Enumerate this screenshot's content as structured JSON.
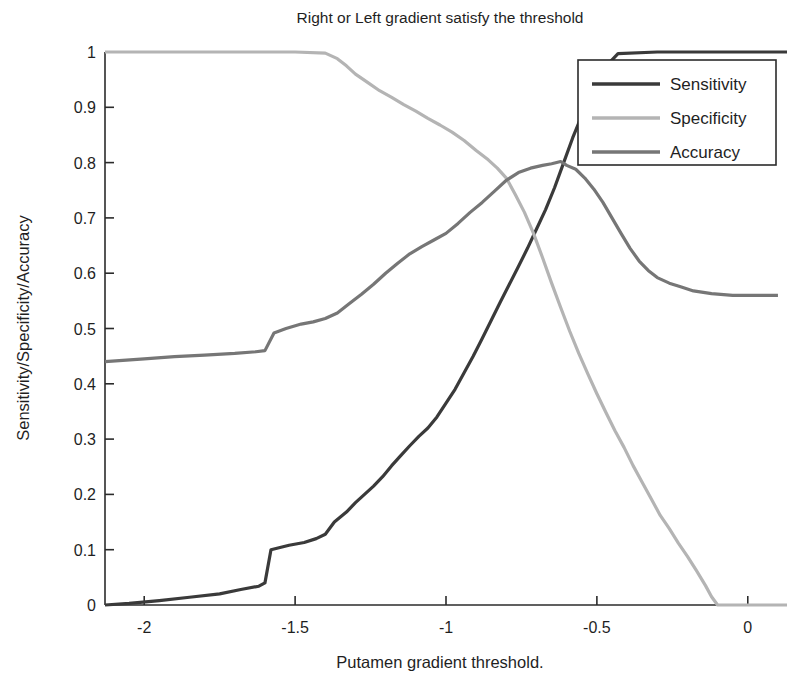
{
  "figure": {
    "title": "Right or Left gradient satisfy the threshold",
    "xlabel": "Putamen gradient threshold.",
    "ylabel": "Sensitivity/Specificity/Accuracy",
    "background": "#ffffff"
  },
  "legend": {
    "position": "top-right",
    "entries": [
      {
        "label": "Sensitivity",
        "color": "#3a3a3a"
      },
      {
        "label": "Specificity",
        "color": "#b4b4b4"
      },
      {
        "label": "Accuracy",
        "color": "#767676"
      }
    ]
  },
  "axes": {
    "x_ticks": [
      "-2",
      "-1.5",
      "-1",
      "-0.5",
      "0"
    ],
    "x_tick_values": [
      -2,
      -1.5,
      -1,
      -0.5,
      0
    ],
    "y_ticks": [
      "0",
      "0.1",
      "0.2",
      "0.3",
      "0.4",
      "0.5",
      "0.6",
      "0.7",
      "0.8",
      "0.9",
      "1"
    ],
    "y_tick_values": [
      0,
      0.1,
      0.2,
      0.3,
      0.4,
      0.5,
      0.6,
      0.7,
      0.8,
      0.9,
      1
    ],
    "xlim": [
      -2.13,
      0.13
    ],
    "ylim": [
      0,
      1
    ],
    "grid": false
  },
  "chart_data": {
    "type": "line",
    "title": "Right or Left gradient satisfy the threshold",
    "xlabel": "Putamen gradient threshold.",
    "ylabel": "Sensitivity/Specificity/Accuracy",
    "xlim": [
      -2.13,
      0.13
    ],
    "ylim": [
      0,
      1
    ],
    "grid": false,
    "legend_position": "top-right",
    "series": [
      {
        "name": "Sensitivity",
        "color": "#3a3a3a",
        "x": [
          -2.13,
          -2.05,
          -1.95,
          -1.85,
          -1.75,
          -1.68,
          -1.62,
          -1.6,
          -1.58,
          -1.52,
          -1.47,
          -1.43,
          -1.4,
          -1.37,
          -1.33,
          -1.3,
          -1.27,
          -1.24,
          -1.21,
          -1.18,
          -1.15,
          -1.12,
          -1.09,
          -1.06,
          -1.03,
          -1.0,
          -0.97,
          -0.94,
          -0.91,
          -0.88,
          -0.85,
          -0.82,
          -0.79,
          -0.76,
          -0.73,
          -0.7,
          -0.67,
          -0.64,
          -0.61,
          -0.58,
          -0.55,
          -0.52,
          -0.49,
          -0.46,
          -0.43,
          -0.3,
          -0.15,
          0.0,
          0.13
        ],
        "y": [
          0.0,
          0.003,
          0.008,
          0.014,
          0.02,
          0.028,
          0.034,
          0.04,
          0.1,
          0.108,
          0.113,
          0.12,
          0.128,
          0.15,
          0.168,
          0.185,
          0.2,
          0.215,
          0.232,
          0.252,
          0.27,
          0.288,
          0.305,
          0.32,
          0.34,
          0.365,
          0.39,
          0.42,
          0.45,
          0.482,
          0.515,
          0.548,
          0.58,
          0.612,
          0.645,
          0.68,
          0.715,
          0.755,
          0.8,
          0.845,
          0.885,
          0.92,
          0.955,
          0.98,
          0.997,
          1.0,
          1.0,
          1.0,
          1.0
        ]
      },
      {
        "name": "Specificity",
        "color": "#b4b4b4",
        "x": [
          -2.13,
          -1.8,
          -1.5,
          -1.4,
          -1.36,
          -1.33,
          -1.3,
          -1.26,
          -1.22,
          -1.18,
          -1.14,
          -1.1,
          -1.06,
          -1.02,
          -0.98,
          -0.94,
          -0.9,
          -0.86,
          -0.83,
          -0.8,
          -0.77,
          -0.74,
          -0.71,
          -0.68,
          -0.65,
          -0.62,
          -0.59,
          -0.56,
          -0.53,
          -0.5,
          -0.47,
          -0.44,
          -0.41,
          -0.38,
          -0.35,
          -0.32,
          -0.29,
          -0.26,
          -0.23,
          -0.2,
          -0.17,
          -0.14,
          -0.12,
          -0.1,
          0.0,
          0.13
        ],
        "y": [
          1.0,
          1.0,
          1.0,
          0.998,
          0.988,
          0.975,
          0.96,
          0.945,
          0.93,
          0.918,
          0.905,
          0.893,
          0.88,
          0.868,
          0.855,
          0.84,
          0.822,
          0.805,
          0.79,
          0.772,
          0.742,
          0.71,
          0.672,
          0.628,
          0.582,
          0.538,
          0.495,
          0.455,
          0.418,
          0.382,
          0.348,
          0.315,
          0.285,
          0.252,
          0.222,
          0.192,
          0.162,
          0.138,
          0.112,
          0.088,
          0.062,
          0.035,
          0.015,
          0.0,
          0.0,
          0.0
        ]
      },
      {
        "name": "Accuracy",
        "color": "#767676",
        "x": [
          -2.13,
          -2.0,
          -1.9,
          -1.8,
          -1.7,
          -1.63,
          -1.6,
          -1.57,
          -1.53,
          -1.48,
          -1.44,
          -1.4,
          -1.36,
          -1.32,
          -1.28,
          -1.24,
          -1.2,
          -1.16,
          -1.12,
          -1.08,
          -1.04,
          -1.0,
          -0.96,
          -0.92,
          -0.88,
          -0.84,
          -0.8,
          -0.76,
          -0.72,
          -0.68,
          -0.65,
          -0.62,
          -0.6,
          -0.57,
          -0.54,
          -0.51,
          -0.48,
          -0.45,
          -0.42,
          -0.39,
          -0.36,
          -0.33,
          -0.3,
          -0.26,
          -0.22,
          -0.18,
          -0.12,
          -0.05,
          0.02,
          0.1
        ],
        "y": [
          0.44,
          0.445,
          0.449,
          0.452,
          0.455,
          0.458,
          0.46,
          0.492,
          0.5,
          0.508,
          0.512,
          0.518,
          0.528,
          0.545,
          0.562,
          0.58,
          0.6,
          0.618,
          0.635,
          0.648,
          0.66,
          0.672,
          0.69,
          0.71,
          0.728,
          0.748,
          0.768,
          0.782,
          0.79,
          0.795,
          0.798,
          0.802,
          0.795,
          0.788,
          0.772,
          0.752,
          0.728,
          0.7,
          0.672,
          0.645,
          0.622,
          0.605,
          0.592,
          0.582,
          0.575,
          0.568,
          0.563,
          0.56,
          0.56,
          0.56
        ]
      }
    ]
  }
}
